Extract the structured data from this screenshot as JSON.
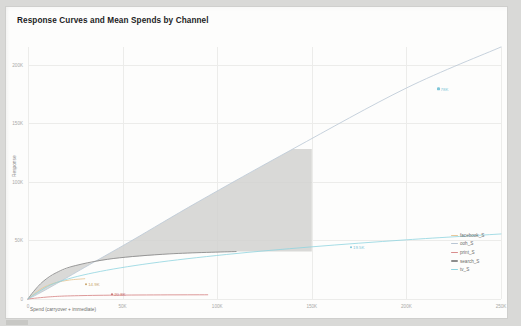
{
  "chart_title": "Response Curves and Mean Spends by Channel",
  "axes": {
    "xlabel": "Spend (carryover + immediate)",
    "ylabel": "Response",
    "xticks": [
      "0",
      "50K",
      "100K",
      "150K",
      "200K",
      "250K"
    ],
    "xtick_values": [
      0,
      50000,
      100000,
      150000,
      200000,
      250000
    ],
    "yticks": [
      "0",
      "50K",
      "100K",
      "150K",
      "200K"
    ],
    "ytick_values": [
      0,
      50000,
      100000,
      150000,
      200000
    ]
  },
  "legend": {
    "position": "right",
    "entries": [
      {
        "label": "facebook_S",
        "color": "#e8c89a"
      },
      {
        "label": "ooh_S",
        "color": "#b9c6d4"
      },
      {
        "label": "print_S",
        "color": "#d98d8d"
      },
      {
        "label": "search_S",
        "color": "#8d8d8d"
      },
      {
        "label": "tv_S",
        "color": "#8fd4e0"
      }
    ]
  },
  "annotations": [
    {
      "label": "14.9K",
      "color": "#c9a46a",
      "x_pct": 12.0,
      "y_pct": 94.0
    },
    {
      "label": "20.8K",
      "color": "#c96f6f",
      "x_pct": 17.5,
      "y_pct": 98.0
    },
    {
      "label": "19.5K",
      "color": "#7fc6d8",
      "x_pct": 68.0,
      "y_pct": 79.5
    },
    {
      "label": "78K",
      "color": "#7fc6d8",
      "x_pct": 86.5,
      "y_pct": 16.5
    }
  ],
  "chart_data": {
    "type": "line",
    "title": "Response Curves and Mean Spends by Channel",
    "xlabel": "Spend (carryover + immediate)",
    "ylabel": "Response",
    "xlim": [
      0,
      250000
    ],
    "ylim": [
      0,
      215000
    ],
    "grid": true,
    "legend_position": "right",
    "series": [
      {
        "name": "facebook_S",
        "color": "#e8c89a",
        "mean_spend": 14900,
        "mean_spend_label": "14.9K",
        "x": [
          0,
          2000,
          5000,
          9000,
          14900,
          22000,
          30000
        ],
        "y": [
          0,
          2600,
          6500,
          10500,
          14000,
          16200,
          17300
        ]
      },
      {
        "name": "ooh_S",
        "color": "#b9c6d4",
        "mean_spend": 0,
        "x": [
          0,
          5000,
          15000,
          30000,
          55000,
          90000,
          140000,
          200000,
          250000
        ],
        "y": [
          0,
          4000,
          13000,
          27000,
          50000,
          83000,
          128000,
          180000,
          215000
        ]
      },
      {
        "name": "print_S",
        "color": "#d98d8d",
        "mean_spend": 20800,
        "mean_spend_label": "20.8K",
        "x": [
          0,
          5000,
          12000,
          20800,
          40000,
          70000,
          95000
        ],
        "y": [
          0,
          900,
          1900,
          2600,
          3200,
          3500,
          3600
        ]
      },
      {
        "name": "search_S",
        "color": "#8d8d8d",
        "mean_spend": 0,
        "x": [
          0,
          3000,
          8000,
          15000,
          25000,
          45000,
          75000,
          110000
        ],
        "y": [
          0,
          6500,
          15000,
          22500,
          28500,
          34500,
          38500,
          40500
        ]
      },
      {
        "name": "tv_S",
        "color": "#8fd4e0",
        "mean_spend": 19500,
        "mean_spend_label": "19.5K",
        "x": [
          0,
          5000,
          15000,
          35000,
          65000,
          105000,
          150000,
          200000,
          250000
        ],
        "y": [
          0,
          5500,
          14000,
          22500,
          30500,
          38000,
          44500,
          50500,
          55500
        ]
      }
    ],
    "shaded_band": {
      "series": "tv_S",
      "label": "uncertainty band",
      "color": "#d2d2d0",
      "x_start": 0,
      "x_end": 150000
    }
  }
}
